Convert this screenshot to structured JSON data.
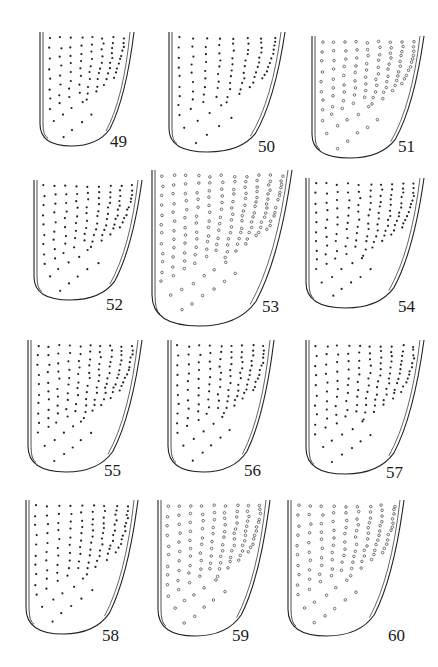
{
  "figure": {
    "ink_color": "#222222",
    "background": "#ffffff",
    "panels": [
      {
        "id": "49",
        "label": "49",
        "x": 36,
        "y": 32,
        "w": 100,
        "h": 118,
        "label_x": 110,
        "label_y": 133,
        "dot": "filled",
        "rows": 10,
        "cols": 8
      },
      {
        "id": "50",
        "label": "50",
        "x": 165,
        "y": 32,
        "w": 122,
        "h": 124,
        "label_x": 258,
        "label_y": 138,
        "dot": "filled",
        "rows": 11,
        "cols": 8
      },
      {
        "id": "51",
        "label": "51",
        "x": 308,
        "y": 36,
        "w": 118,
        "h": 126,
        "label_x": 398,
        "label_y": 138,
        "dot": "open",
        "rows": 11,
        "cols": 9
      },
      {
        "id": "52",
        "label": "52",
        "x": 30,
        "y": 180,
        "w": 114,
        "h": 124,
        "label_x": 106,
        "label_y": 296,
        "dot": "filled",
        "rows": 11,
        "cols": 9
      },
      {
        "id": "53",
        "label": "53",
        "x": 148,
        "y": 170,
        "w": 146,
        "h": 160,
        "label_x": 262,
        "label_y": 298,
        "dot": "open",
        "rows": 14,
        "cols": 11
      },
      {
        "id": "54",
        "label": "54",
        "x": 302,
        "y": 178,
        "w": 124,
        "h": 134,
        "label_x": 398,
        "label_y": 298,
        "dot": "filled",
        "rows": 12,
        "cols": 10
      },
      {
        "id": "55",
        "label": "55",
        "x": 24,
        "y": 340,
        "w": 120,
        "h": 136,
        "label_x": 104,
        "label_y": 462,
        "dot": "filled",
        "rows": 12,
        "cols": 10
      },
      {
        "id": "56",
        "label": "56",
        "x": 164,
        "y": 340,
        "w": 112,
        "h": 136,
        "label_x": 244,
        "label_y": 462,
        "dot": "filled",
        "rows": 12,
        "cols": 9
      },
      {
        "id": "57",
        "label": "57",
        "x": 302,
        "y": 340,
        "w": 124,
        "h": 138,
        "label_x": 386,
        "label_y": 464,
        "dot": "filled",
        "rows": 12,
        "cols": 10
      },
      {
        "id": "58",
        "label": "58",
        "x": 22,
        "y": 500,
        "w": 118,
        "h": 138,
        "label_x": 102,
        "label_y": 627,
        "dot": "filled",
        "rows": 12,
        "cols": 9
      },
      {
        "id": "59",
        "label": "59",
        "x": 154,
        "y": 500,
        "w": 118,
        "h": 140,
        "label_x": 232,
        "label_y": 627,
        "dot": "open",
        "rows": 12,
        "cols": 9
      },
      {
        "id": "60",
        "label": "60",
        "x": 284,
        "y": 500,
        "w": 122,
        "h": 140,
        "label_x": 388,
        "label_y": 627,
        "dot": "open",
        "rows": 12,
        "cols": 9
      }
    ]
  }
}
